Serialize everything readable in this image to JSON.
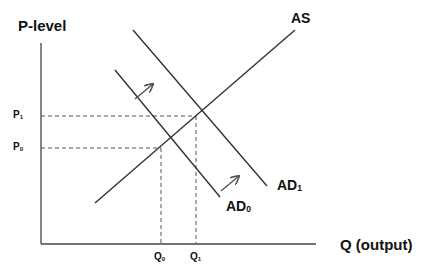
{
  "diagram": {
    "y_axis_label": "P-level",
    "x_axis_label": "Q (output)",
    "curves": {
      "as": {
        "label": "AS"
      },
      "ad0": {
        "label": "AD",
        "sub": "0"
      },
      "ad1": {
        "label": "AD",
        "sub": "1"
      }
    },
    "price_levels": [
      {
        "label": "P",
        "sub": "1"
      },
      {
        "label": "P",
        "sub": "0"
      }
    ],
    "quantities": [
      {
        "label": "Q",
        "sub": "0"
      },
      {
        "label": "Q",
        "sub": "1"
      }
    ],
    "shift_arrows": 2,
    "colors": {
      "line": "#333333",
      "dash": "#555555",
      "text": "#111111",
      "background": "#ffffff"
    }
  }
}
